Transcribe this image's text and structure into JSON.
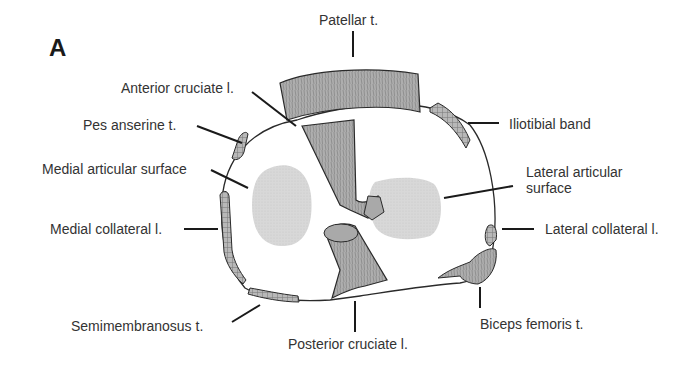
{
  "figure": {
    "panel_label": "A"
  },
  "labels": {
    "patellar_tendon": "Patellar t.",
    "anterior_cruciate": "Anterior cruciate l.",
    "pes_anserine": "Pes anserine t.",
    "iliotibial_band": "Iliotibial band",
    "medial_articular": "Medial articular surface",
    "lateral_articular_1": "Lateral articular",
    "lateral_articular_2": "surface",
    "medial_collateral": "Medial collateral l.",
    "lateral_collateral": "Lateral collateral l.",
    "semimembranosus": "Semimembranosus t.",
    "posterior_cruciate": "Posterior cruciate l.",
    "biceps_femoris": "Biceps femoris t."
  },
  "colors": {
    "outline": "#2a2a2a",
    "tissue_fill": "#b0b0b0",
    "articular_fill": "#d6d6d6",
    "background": "#ffffff"
  }
}
